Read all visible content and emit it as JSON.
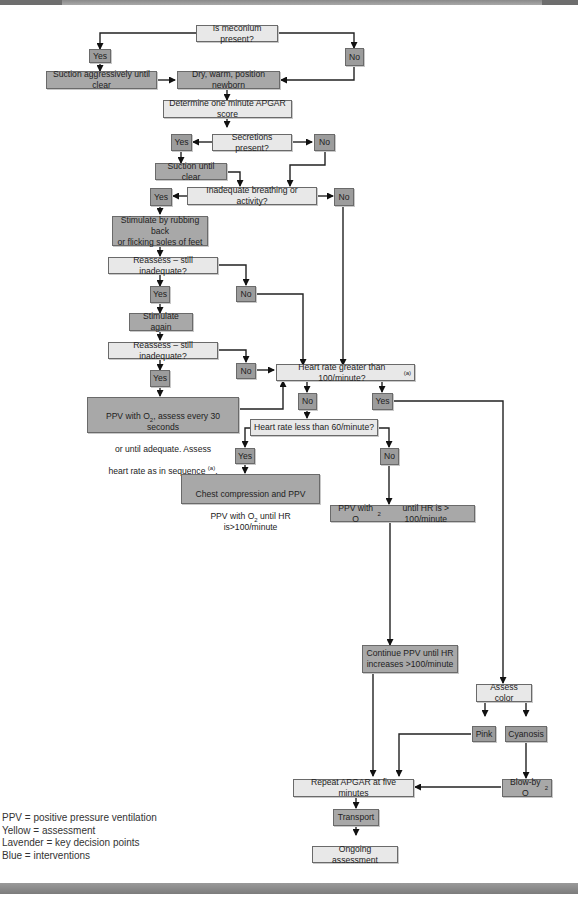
{
  "header": {
    "title_partial": ""
  },
  "nodes": {
    "meconium": "Is meconium present?",
    "mec_yes": "Yes",
    "mec_no": "No",
    "suction_aggr": "Suction aggressively until clear",
    "dry_warm": "Dry, warm, position newborn",
    "apgar1": "Determine one minute APGAR score",
    "secretions": "Secretions present?",
    "sec_yes": "Yes",
    "sec_no": "No",
    "suction_clear": "Suction until clear",
    "inadequate": "Inadequate breathing or activity?",
    "inad_yes": "Yes",
    "inad_no": "No",
    "stimulate": "Stimulate by rubbing back\nor flicking soles of feet",
    "reassess1": "Reassess – still inadequate?",
    "re1_yes": "Yes",
    "re1_no": "No",
    "stim_again": "Stimulate again",
    "reassess2": "Reassess – still inadequate?",
    "re2_yes": "Yes",
    "re2_no": "No",
    "ppv_assess_l1": "PPV with O",
    "ppv_assess_sub": "2",
    "ppv_assess_l1b": ", assess every 30 seconds",
    "ppv_assess_l2": "or until adequate. Assess",
    "ppv_assess_l3": "heart rate as in sequence ",
    "ppv_assess_sup": "(a)",
    "ppv_assess_end": ".",
    "hr100": "Heart rate greater than 100/minute?",
    "hr100_sup": "(a)",
    "hr100_no": "No",
    "hr100_yes": "Yes",
    "hr60": "Heart rate less than 60/minute?",
    "hr60_yes": "Yes",
    "hr60_no": "No",
    "chest_l1": "Chest compression and PPV",
    "chest_l2a": "PPV with O",
    "chest_sub": "2",
    "chest_l2b": " until HR is>100/minute",
    "ppv_until_a": "PPV with O",
    "ppv_until_sub": "2",
    "ppv_until_b": " until HR is > 100/minute",
    "continue_ppv": "Continue PPV until HR\nincreases >100/minute",
    "assess_color": "Assess color",
    "pink": "Pink",
    "cyanosis": "Cyanosis",
    "blowby_a": "Blow-by O",
    "blowby_sub": "2",
    "repeat_apgar": "Repeat APGAR at five minutes",
    "transport": "Transport",
    "ongoing": "Ongoing assessment"
  },
  "legend": [
    "PPV = positive pressure ventilation",
    "Yellow = assessment",
    "Lavender = key decision points",
    "Blue = interventions"
  ],
  "colors": {
    "assessment": "#e8e8e8",
    "decision": "#9c9c9c",
    "intervention": "#a8a8a8",
    "line": "#222222"
  }
}
